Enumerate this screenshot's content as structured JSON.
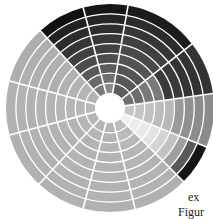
{
  "chart_data": {
    "type": "polar_segmented_ring",
    "title": "",
    "center": [
      110,
      108
    ],
    "inner_radius": 15,
    "outer_radius": 104,
    "ring_count": 9,
    "sector_boundaries_deg": [
      195,
      228,
      255,
      280,
      322,
      352,
      22,
      45,
      76,
      105,
      133,
      165
    ],
    "sectors": [
      {
        "start": 195,
        "end": 228,
        "ring_colors": [
          "#b4b4b4",
          "#b4b4b4",
          "#b2b2b2",
          "#b2b2b2",
          "#b0b0b0",
          "#b0b0b0",
          "#afafaf",
          "#afafaf",
          "#aeaeae"
        ]
      },
      {
        "start": 228,
        "end": 255,
        "ring_colors": [
          "#7a7a7a",
          "#6a6a6a",
          "#5a5a5a",
          "#4c4c4c",
          "#404040",
          "#363636",
          "#2c2c2c",
          "#222222",
          "#111111"
        ]
      },
      {
        "start": 255,
        "end": 280,
        "ring_colors": [
          "#8a8a8a",
          "#707070",
          "#5c5c5c",
          "#4e4e4e",
          "#424242",
          "#383838",
          "#2e2e2e",
          "#252525",
          "#161616"
        ]
      },
      {
        "start": 280,
        "end": 322,
        "ring_colors": [
          "#5c5c5c",
          "#585858",
          "#555555",
          "#545454",
          "#4a4a4a",
          "#404040",
          "#363636",
          "#2c2c2c",
          "#1c1c1c"
        ]
      },
      {
        "start": 322,
        "end": 352,
        "ring_colors": [
          "#707070",
          "#6c6c6c",
          "#7a7a7a",
          "#7a7a7a",
          "#3a3a3a",
          "#3a3a3a",
          "#333333",
          "#333333",
          "#333333"
        ]
      },
      {
        "start": 352,
        "end": 22,
        "ring_colors": [
          "#c6c6c6",
          "#c4c4c4",
          "#c2c2c2",
          "#bcbcbc",
          "#b8b8b8",
          "#9a9a9a",
          "#909090",
          "#8c8c8c",
          "#8a8a8a"
        ]
      },
      {
        "start": 22,
        "end": 45,
        "ring_colors": [
          "#f0f0f0",
          "#ececec",
          "#e8e8e8",
          "#e2e2e2",
          "#d4d4d4",
          "#c2c2c2",
          "#a0a0a0",
          "#5a5a5a",
          "#141414"
        ]
      },
      {
        "start": 45,
        "end": 76,
        "ring_colors": [
          "#bdbdbd",
          "#bbbbbb",
          "#b8b8b8",
          "#b6b6b6",
          "#b5b5b5",
          "#b4b4b4",
          "#b3b3b3",
          "#b2b2b2",
          "#b0b0b0"
        ]
      },
      {
        "start": 76,
        "end": 105,
        "ring_colors": [
          "#b6b6b6",
          "#b5b5b5",
          "#b4b4b4",
          "#b4b4b4",
          "#b3b3b3",
          "#b3b3b3",
          "#b2b2b2",
          "#b2b2b2",
          "#b1b1b1"
        ]
      },
      {
        "start": 105,
        "end": 133,
        "ring_colors": [
          "#b6b6b6",
          "#b5b5b5",
          "#b4b4b4",
          "#b4b4b4",
          "#b3b3b3",
          "#b3b3b3",
          "#b2b2b2",
          "#b2b2b2",
          "#b1b1b1"
        ]
      },
      {
        "start": 133,
        "end": 165,
        "ring_colors": [
          "#b6b6b6",
          "#b5b5b5",
          "#b4b4b4",
          "#b4b4b4",
          "#b3b3b3",
          "#b3b3b3",
          "#b2b2b2",
          "#b2b2b2",
          "#b1b1b1"
        ]
      },
      {
        "start": 165,
        "end": 195,
        "ring_colors": [
          "#b8b8b8",
          "#b7b7b7",
          "#b6b6b6",
          "#b5b5b5",
          "#b4b4b4",
          "#b3b3b3",
          "#b2b2b2",
          "#b2b2b2",
          "#b1b1b1"
        ]
      }
    ],
    "grid_line_color": "#ffffff",
    "legend": [],
    "xlabel": "",
    "ylabel": ""
  },
  "caption_fragments": {
    "line1": "ex",
    "line2": "Figur"
  }
}
